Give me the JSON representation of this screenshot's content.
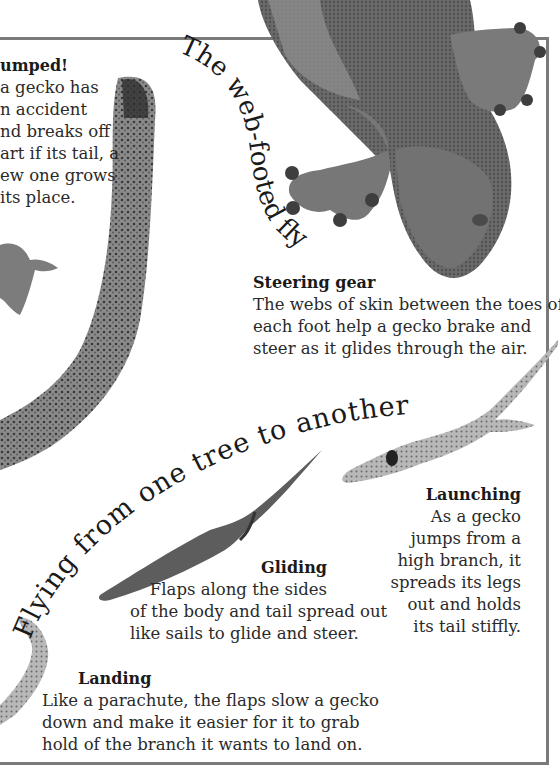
{
  "page": {
    "frame_color": "#7a7a7a",
    "text_color": "#2a2a2a"
  },
  "titles": {
    "curved_title": "The web-footed flyer",
    "arc_title": "Flying from one tree to another"
  },
  "captions": {
    "dumped": {
      "heading": "umped!",
      "lines": [
        "a gecko has",
        "n accident",
        "nd breaks off",
        "art if its tail, a",
        "ew one grows",
        " its place."
      ]
    },
    "steering": {
      "heading": "Steering gear",
      "lines": [
        "The webs of skin between the toes of",
        "each foot help a gecko brake and",
        "steer as it glides through the air."
      ]
    },
    "gliding": {
      "heading": "Gliding",
      "lines": [
        "Flaps along the sides",
        "of the body and tail spread out",
        "like sails to glide and steer."
      ]
    },
    "launching": {
      "heading": "Launching",
      "lines": [
        "As a gecko",
        "jumps from a",
        "high branch, it",
        "spreads its legs",
        "out and holds",
        "its tail stiffly."
      ]
    },
    "landing": {
      "heading": "Landing",
      "lines": [
        "Like a parachute, the flaps slow a gecko",
        "down and make it easier for it to grab",
        "hold of the branch it wants to land on."
      ]
    }
  },
  "images": {
    "gecko_underside": "gecko-underside-photo",
    "gecko_tail": "gecko-tail-photo",
    "gecko_gliding": "gecko-gliding-photo",
    "gecko_launching": "gecko-launching-photo",
    "gecko_landing": "gecko-landing-photo"
  }
}
